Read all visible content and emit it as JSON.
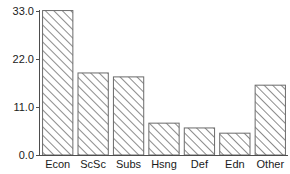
{
  "chart_data": {
    "type": "bar",
    "title": "",
    "subtitle": "",
    "xlabel": "",
    "ylabel": "",
    "categories": [
      "Econ",
      "ScSc",
      "Subs",
      "Hsng",
      "Def",
      "Edn",
      "Other"
    ],
    "values": [
      33.1,
      18.8,
      17.9,
      7.3,
      6.2,
      5.0,
      16.0
    ],
    "ylim": [
      0.0,
      35.0
    ],
    "yticks": [
      0.0,
      11.0,
      22.0,
      33.0
    ],
    "ytick_labels": [
      "0.0",
      "11.0",
      "22.0",
      "33.0"
    ],
    "grid": false,
    "legend": "none",
    "bar_fill": "diagonal-hatch",
    "bar_edge_color": "#6b6b6b",
    "hatch_color": "#8c8c8c",
    "axis_color": "#4d4d4d",
    "background_color": "#ffffff",
    "text_color": "#1a1a1a"
  }
}
